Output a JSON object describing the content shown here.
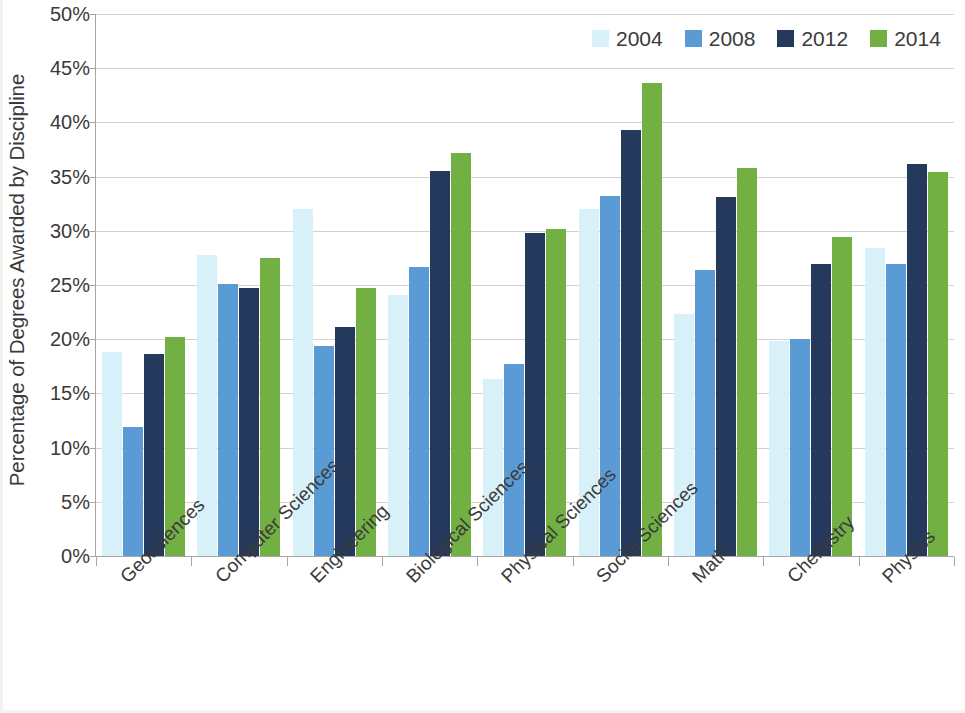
{
  "chart_data": {
    "type": "bar",
    "title": "",
    "xlabel": "",
    "ylabel": "Percentage of Degrees Awarded by Discipline",
    "ylim": [
      0,
      50
    ],
    "ytick_labels": [
      "50%",
      "45%",
      "40%",
      "35%",
      "30%",
      "25%",
      "20%",
      "15%",
      "10%",
      "5%",
      "0%"
    ],
    "ytick_values": [
      50,
      45,
      40,
      35,
      30,
      25,
      20,
      15,
      10,
      5,
      0
    ],
    "grid": true,
    "legend_position": "top-right",
    "categories": [
      "Geosciences",
      "Computer Sciences",
      "Engineering",
      "Biological Sciences",
      "Physical Sciences",
      "Social Sciences",
      "Math",
      "Chemistry",
      "Physics"
    ],
    "series": [
      {
        "name": "2004",
        "color": "#d8f0f8",
        "values": [
          18.8,
          27.8,
          32.0,
          24.1,
          16.3,
          32.0,
          22.3,
          19.8,
          28.4
        ]
      },
      {
        "name": "2008",
        "color": "#5b9bd5",
        "values": [
          11.9,
          25.1,
          19.4,
          26.7,
          17.7,
          33.2,
          26.4,
          20.0,
          26.9
        ]
      },
      {
        "name": "2012",
        "color": "#24395c",
        "values": [
          18.6,
          24.7,
          21.1,
          35.5,
          29.8,
          39.3,
          33.1,
          26.9,
          36.2
        ]
      },
      {
        "name": "2014",
        "color": "#72b043",
        "values": [
          20.2,
          27.5,
          24.7,
          37.2,
          30.2,
          43.6,
          35.8,
          29.4,
          35.4
        ]
      }
    ]
  },
  "legend": {
    "items": [
      {
        "label": "2004",
        "color": "#d8f0f8"
      },
      {
        "label": "2008",
        "color": "#5b9bd5"
      },
      {
        "label": "2012",
        "color": "#24395c"
      },
      {
        "label": "2014",
        "color": "#72b043"
      }
    ]
  },
  "axes": {
    "y_title": "Percentage of Degrees Awarded by Discipline"
  }
}
